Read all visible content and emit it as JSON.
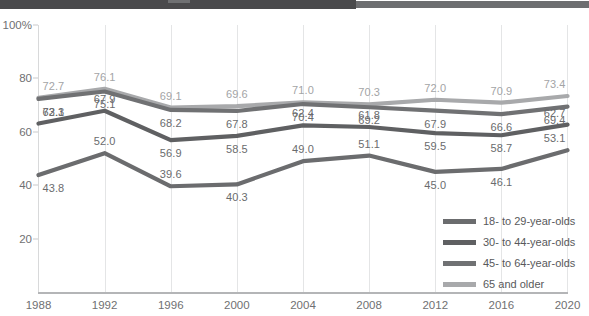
{
  "top_strip": {
    "name": "cropped-header-bar",
    "dark_color": "#4a4a4c",
    "light_color": "#6d6e70"
  },
  "chart_data": {
    "type": "line",
    "title": "",
    "xlabel": "",
    "ylabel": "",
    "grid": "vertical",
    "legend_position": "inside-bottom-right",
    "xlim": [
      1988,
      2020
    ],
    "ylim": [
      0,
      100
    ],
    "yticks": [
      "100%",
      "80",
      "60",
      "40",
      "20"
    ],
    "ytick_values": [
      100,
      80,
      60,
      40,
      20
    ],
    "categories": [
      1988,
      1992,
      1996,
      2000,
      2004,
      2008,
      2012,
      2016,
      2020
    ],
    "xtick_labels": [
      "1988",
      "1992",
      "1996",
      "2000",
      "2004",
      "2008",
      "2012",
      "2016",
      "2020"
    ],
    "series": [
      {
        "name": "18- to 29-year-olds",
        "color": "#6b6c6e",
        "values": [
          43.8,
          52.0,
          39.6,
          40.3,
          49.0,
          51.1,
          45.0,
          46.1,
          53.1
        ],
        "labels": [
          "43.8",
          "52.0",
          "39.6",
          "40.3",
          "49.0",
          "51.1",
          "45.0",
          "46.1",
          "53.1"
        ],
        "label_side": [
          "below",
          "above",
          "above",
          "below",
          "above",
          "above",
          "below",
          "below",
          "above"
        ]
      },
      {
        "name": "30- to 44-year-olds",
        "color": "#5f6062",
        "values": [
          63.1,
          67.9,
          56.9,
          58.5,
          62.4,
          61.8,
          59.5,
          58.7,
          62.7
        ],
        "labels": [
          "63.1",
          "67.9",
          "56.9",
          "58.5",
          "62.4",
          "61.8",
          "59.5",
          "58.7",
          "62.7"
        ],
        "label_side": [
          "above",
          "above",
          "below",
          "below",
          "above",
          "above",
          "below",
          "below",
          "above"
        ]
      },
      {
        "name": "45- to 64-year-olds",
        "color": "#707173",
        "values": [
          72.3,
          75.1,
          68.2,
          67.8,
          70.4,
          69.2,
          67.9,
          66.6,
          69.4
        ],
        "labels": [
          "72.3",
          "75.1",
          "68.2",
          "67.8",
          "70.4",
          "69.2",
          "67.9",
          "66.6",
          "69.4"
        ],
        "label_side": [
          "below",
          "below",
          "below",
          "below",
          "below",
          "below",
          "below",
          "below",
          "below"
        ]
      },
      {
        "name": "65 and older",
        "color": "#a8a9ab",
        "values": [
          72.7,
          76.1,
          69.1,
          69.6,
          71.0,
          70.3,
          72.0,
          70.9,
          73.4
        ],
        "labels": [
          "72.7",
          "76.1",
          "69.1",
          "69.6",
          "71.0",
          "70.3",
          "72.0",
          "70.9",
          "73.4"
        ],
        "label_side": [
          "above",
          "above",
          "above",
          "above",
          "above",
          "above",
          "above",
          "above",
          "above"
        ]
      }
    ]
  },
  "legend": {
    "items": [
      {
        "label": "18- to 29-year-olds",
        "color": "#6b6c6e"
      },
      {
        "label": "30- to 44-year-olds",
        "color": "#5f6062"
      },
      {
        "label": "45- to 64-year-olds",
        "color": "#707173"
      },
      {
        "label": "65 and older",
        "color": "#a8a9ab"
      }
    ]
  }
}
